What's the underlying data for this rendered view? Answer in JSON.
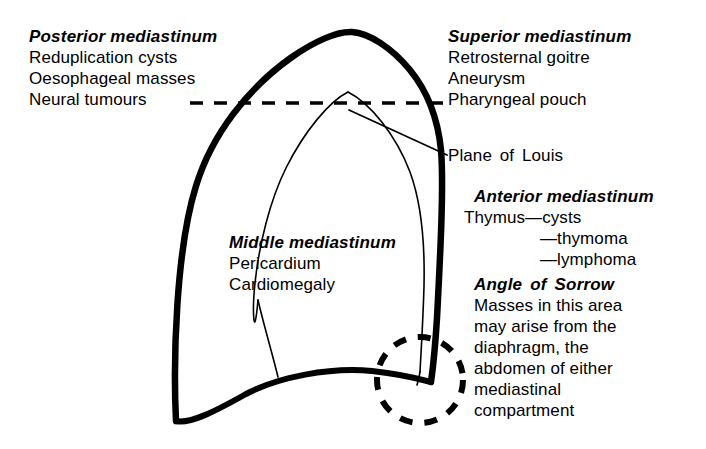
{
  "figure": {
    "ink_color": "#000000",
    "background_color": "#ffffff"
  },
  "labels": {
    "posterior": {
      "heading": "Posterior mediastinum",
      "items": [
        "Reduplication cysts",
        "Oesophageal masses",
        "Neural tumours"
      ]
    },
    "superior": {
      "heading": "Superior mediastinum",
      "items": [
        "Retrosternal goitre",
        "Aneurysm",
        "Pharyngeal pouch"
      ]
    },
    "plane_of_louis": {
      "text": "Plane of Louis"
    },
    "anterior": {
      "heading": "Anterior mediastinum",
      "items": [
        "Thymus—cysts",
        "—thymoma",
        "—lymphoma"
      ]
    },
    "middle": {
      "heading": "Middle mediastinum",
      "items": [
        "Pericardium",
        "Cardiomegaly"
      ]
    },
    "angle_of_sorrow": {
      "heading": "Angle of Sorrow",
      "items": [
        "Masses in this area",
        "may arise from the",
        "diaphragm, the",
        "abdomen of either",
        "mediastinal",
        "compartment"
      ]
    }
  },
  "graphics": {
    "lung_outline_name": "thoracic-outline",
    "mediastinum_outline_name": "mediastinal-outline",
    "plane_of_louis_line_name": "plane-of-louis-dashed-line",
    "highlight_circle_name": "angle-of-sorrow-circle",
    "leader_lines": [
      "plane-of-louis-leader",
      "cardiomegaly-leader"
    ]
  }
}
